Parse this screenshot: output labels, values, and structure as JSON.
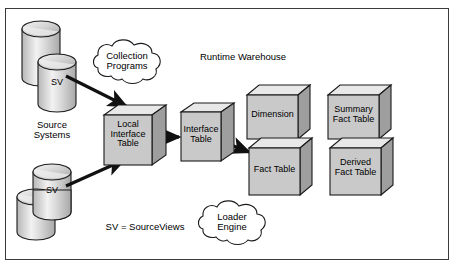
{
  "diagram": {
    "title": "Runtime Warehouse",
    "frame": {
      "name": "diagram-border"
    },
    "legend": "SV = SourceViews",
    "group_labels": [
      {
        "id": "source-systems",
        "text": "Source\nSystems"
      },
      {
        "id": "runtime-warehouse",
        "text": "Runtime Warehouse"
      }
    ],
    "cylinders": [
      {
        "id": "source-db-top-back",
        "label": ""
      },
      {
        "id": "source-db-top-front",
        "label": "SV"
      },
      {
        "id": "source-db-bottom-front",
        "label": "SV"
      },
      {
        "id": "source-db-bottom-back",
        "label": ""
      }
    ],
    "clouds": [
      {
        "id": "collection-programs",
        "label": "Collection\nPrograms"
      },
      {
        "id": "loader-engine",
        "label": "Loader\nEngine"
      }
    ],
    "boxes": [
      {
        "id": "local-interface-table",
        "label": "Local\nInterface\nTable"
      },
      {
        "id": "interface-table",
        "label": "Interface\nTable"
      },
      {
        "id": "dimension",
        "label": "Dimension"
      },
      {
        "id": "fact-table",
        "label": "Fact Table"
      },
      {
        "id": "summary-fact-table",
        "label": "Summary\nFact Table"
      },
      {
        "id": "derived-fact-table",
        "label": "Derived\nFact Table"
      }
    ],
    "arrows": [
      {
        "id": "arrow-collection-to-local",
        "from": "collection-programs",
        "to": "local-interface-table"
      },
      {
        "id": "arrow-sv-to-local",
        "from": "source-db-bottom-front",
        "to": "local-interface-table"
      },
      {
        "id": "arrow-local-to-interface",
        "from": "local-interface-table",
        "to": "interface-table"
      },
      {
        "id": "arrow-interface-to-fact",
        "from": "interface-table",
        "to": "fact-table"
      }
    ],
    "colors": {
      "stroke": "#1a1a1a",
      "box_face": "#c9c9c9",
      "box_top": "#e8e8e8",
      "box_side": "#9e9e9e",
      "cyl_light": "#efefef",
      "cyl_dark": "#9a9a9a",
      "background": "#ffffff",
      "frame": "#3a3a3a"
    }
  }
}
